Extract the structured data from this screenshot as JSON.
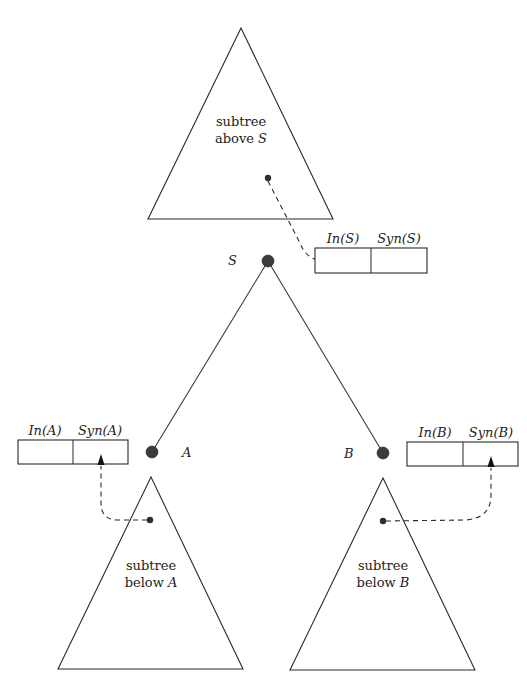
{
  "diagram": {
    "subtree_above": {
      "line1": "subtree",
      "line2_prefix": "above ",
      "line2_var": "S"
    },
    "subtree_below_a": {
      "line1": "subtree",
      "line2_prefix": "below ",
      "line2_var": "A"
    },
    "subtree_below_b": {
      "line1": "subtree",
      "line2_prefix": "below ",
      "line2_var": "B"
    },
    "nodes": {
      "s": {
        "label": "S"
      },
      "a": {
        "label": "A"
      },
      "b": {
        "label": "B"
      }
    },
    "boxes": {
      "s": {
        "inherited_label": "In(S)",
        "synthesized_label": "Syn(S)"
      },
      "a": {
        "inherited_label": "In(A)",
        "synthesized_label": "Syn(A)"
      },
      "b": {
        "inherited_label": "In(B)",
        "synthesized_label": "Syn(B)"
      }
    },
    "colors": {
      "stroke": "#2a2a2a",
      "node_fill": "#3b3b3b",
      "background": "#ffffff"
    }
  }
}
